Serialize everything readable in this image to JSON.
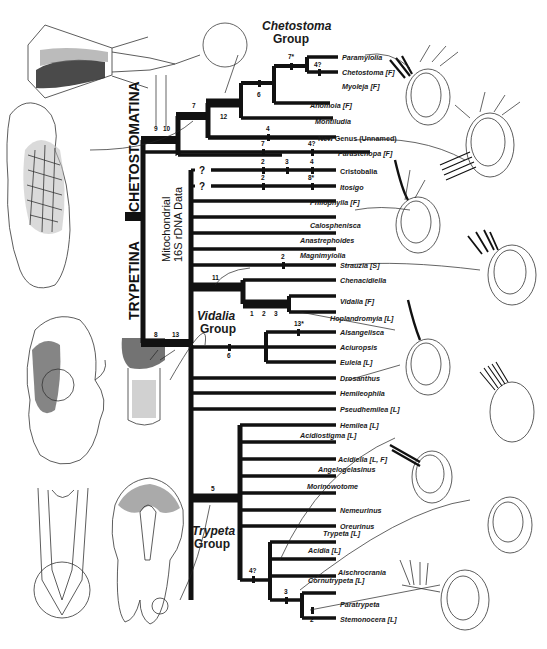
{
  "figure": {
    "subfamilies": {
      "trypetina": "TRYPETINA",
      "chetostomatina": "CHETOSTOMATINA"
    },
    "data_label": {
      "line1": "Mitochondrial",
      "line2": "16S rDNA Data"
    },
    "groups": {
      "chetostoma": {
        "line1": "Chetostoma",
        "line2": "Group"
      },
      "vidalia": {
        "line1": "Vidalia",
        "line2": "Group"
      },
      "trypeta": {
        "line1": "Trypeta",
        "line2": "Group"
      }
    },
    "unknown_mark": "?",
    "taxa": [
      {
        "name": "Paramyiolia",
        "tag": ""
      },
      {
        "name": "Chetostoma",
        "tag": "[F]"
      },
      {
        "name": "Myoleja",
        "tag": "[F]"
      },
      {
        "name": "Anomoia",
        "tag": "[F]"
      },
      {
        "name": "Montiludia",
        "tag": ""
      },
      {
        "name": "New Genus (Unnamed)",
        "tag": ""
      },
      {
        "name": "Parastenopa",
        "tag": "[F]"
      },
      {
        "name": "Cristobalia",
        "tag": ""
      },
      {
        "name": "Itosigo",
        "tag": ""
      },
      {
        "name": "Philophylla",
        "tag": "[F]"
      },
      {
        "name": "Calosphenisca",
        "tag": ""
      },
      {
        "name": "Anastrephoides",
        "tag": ""
      },
      {
        "name": "Magnimyiolia",
        "tag": ""
      },
      {
        "name": "Strauzia",
        "tag": "[S]"
      },
      {
        "name": "Chenacidiella",
        "tag": ""
      },
      {
        "name": "Vidalia",
        "tag": "[F]"
      },
      {
        "name": "Hoplandromyia",
        "tag": "[L]"
      },
      {
        "name": "Alsangelisca",
        "tag": ""
      },
      {
        "name": "Aciuropsis",
        "tag": ""
      },
      {
        "name": "Euleia",
        "tag": "[L]"
      },
      {
        "name": "Drosanthus",
        "tag": ""
      },
      {
        "name": "Hemileophila",
        "tag": ""
      },
      {
        "name": "Pseudhemilea",
        "tag": "[L]"
      },
      {
        "name": "Hemilea",
        "tag": "[L]"
      },
      {
        "name": "Acidiostigma",
        "tag": "[L]"
      },
      {
        "name": "Acidiella",
        "tag": "[L, F]"
      },
      {
        "name": "Angelogelasinus",
        "tag": ""
      },
      {
        "name": "Morinowotome",
        "tag": ""
      },
      {
        "name": "Nemeurinus",
        "tag": ""
      },
      {
        "name": "Oreurinus",
        "tag": ""
      },
      {
        "name": "Trypeta",
        "tag": "[L]"
      },
      {
        "name": "Acidia",
        "tag": "[L]"
      },
      {
        "name": "Aischrocrania",
        "tag": ""
      },
      {
        "name": "Cornutrypeta",
        "tag": "[L]"
      },
      {
        "name": "Paratrypeta",
        "tag": ""
      },
      {
        "name": "Stemonocera",
        "tag": "[L]"
      }
    ],
    "character_marks": {
      "m9": "9",
      "m10": "10",
      "m7a": "7",
      "m12": "12",
      "m6a": "6",
      "m7star": "7*",
      "m47a": "4?",
      "m4a": "4",
      "m7b": "7",
      "m47b": "4?",
      "m2a": "2",
      "m3a": "3",
      "m4b": "4",
      "m2b": "2",
      "m8star": "8*",
      "m8": "8",
      "m13": "13",
      "m11": "11",
      "m2c": "2",
      "m1": "1",
      "m1b": "1",
      "m2d": "2",
      "m3b": "3",
      "m13star": "13*",
      "m6b": "6",
      "m5": "5",
      "m47c": "4?",
      "m3c": "3",
      "m2e": "2"
    }
  }
}
